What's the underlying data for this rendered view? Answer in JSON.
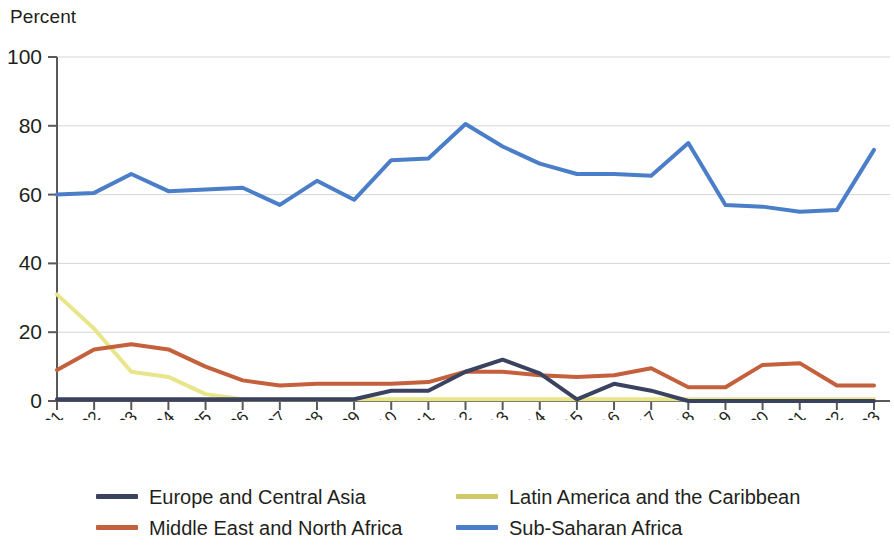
{
  "chart_data": {
    "type": "line",
    "title": "",
    "subtitle": "",
    "ylabel": "Percent",
    "xlabel": "",
    "ylim": [
      0,
      100
    ],
    "yticks": [
      0,
      20,
      40,
      60,
      80,
      100
    ],
    "grid": true,
    "grid_axis": "y",
    "legend_position": "bottom",
    "x": [
      "2001",
      "2002",
      "2003",
      "2004",
      "2005",
      "2006",
      "2007",
      "2008",
      "2009",
      "2010",
      "2011",
      "2012",
      "2013",
      "2014",
      "2015",
      "2016",
      "2017",
      "2018",
      "2019",
      "2020",
      "2021",
      "2022",
      "2023"
    ],
    "categories": [
      "2001",
      "2002",
      "2003",
      "2004",
      "2005",
      "2006",
      "2007",
      "2008",
      "2009",
      "2010",
      "2011",
      "2012",
      "2013",
      "2014",
      "2015",
      "2016",
      "2017",
      "2018",
      "2019",
      "2020",
      "2021",
      "2022",
      "2023"
    ],
    "series": [
      {
        "name": "Europe and Central Asia",
        "color": "#3b4260",
        "values": [
          0.5,
          0.5,
          0.5,
          0.5,
          0.5,
          0.5,
          0.5,
          0.5,
          0.5,
          3,
          3,
          8.5,
          12,
          8,
          0.5,
          5,
          3,
          0,
          0,
          0,
          0,
          0,
          0
        ]
      },
      {
        "name": "Latin America and the Caribbean",
        "color": "#e8e58a",
        "values": [
          31,
          21,
          8.5,
          7,
          2,
          0.5,
          0.5,
          0.5,
          0.5,
          0.5,
          0.5,
          0.5,
          0.5,
          0.5,
          0.5,
          0.5,
          0.5,
          0.5,
          0.5,
          0.5,
          0.5,
          0.5,
          0.5
        ]
      },
      {
        "name": "Middle East and North Africa",
        "color": "#c4603c",
        "values": [
          9,
          15,
          16.5,
          15,
          10,
          6,
          4.5,
          5,
          5,
          5,
          5.5,
          8.5,
          8.5,
          7.5,
          7,
          7.5,
          9.5,
          4,
          4,
          10.5,
          11,
          4.5,
          4.5
        ]
      },
      {
        "name": "Sub-Saharan Africa",
        "color": "#4a7ec9",
        "values": [
          60,
          60.5,
          66,
          61,
          61.5,
          62,
          57,
          64,
          58.5,
          70,
          70.5,
          80.5,
          74,
          69,
          66,
          66,
          65.5,
          75,
          57,
          56.5,
          55,
          55.5,
          73
        ]
      }
    ]
  },
  "legend": {
    "items": [
      {
        "label": "Europe and Central Asia",
        "color": "#3b4260"
      },
      {
        "label": "Latin America and the Caribbean",
        "color": "#cfc96a"
      },
      {
        "label": "Middle East and North Africa",
        "color": "#c4603c"
      },
      {
        "label": "Sub-Saharan Africa",
        "color": "#4a7ec9"
      }
    ]
  }
}
